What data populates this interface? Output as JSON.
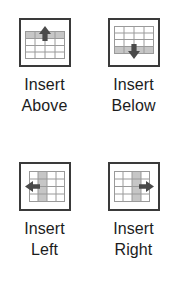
{
  "palette": {
    "background": "#ffffff",
    "frame_border": "#3a3a3a",
    "grid_line": "#9a9a9a",
    "highlight_fill": "#c6c6c6",
    "arrow_fill": "#4a4a4a",
    "label_text": "#1c1c1c"
  },
  "toolbar": {
    "name": "table-insert-commands",
    "commands": [
      {
        "id": "insert-above",
        "icon": "table-insert-row-above-icon",
        "direction": "up",
        "highlight": "top-row",
        "label_line1": "Insert",
        "label_line2": "Above",
        "label_full": "Insert Above"
      },
      {
        "id": "insert-below",
        "icon": "table-insert-row-below-icon",
        "direction": "down",
        "highlight": "bottom-row",
        "label_line1": "Insert",
        "label_line2": "Below",
        "label_full": "Insert Below"
      },
      {
        "id": "insert-left",
        "icon": "table-insert-column-left-icon",
        "direction": "left",
        "highlight": "left-column",
        "label_line1": "Insert",
        "label_line2": "Left",
        "label_full": "Insert Left"
      },
      {
        "id": "insert-right",
        "icon": "table-insert-column-right-icon",
        "direction": "right",
        "highlight": "right-column",
        "label_line1": "Insert",
        "label_line2": "Right",
        "label_full": "Insert Right"
      }
    ]
  }
}
